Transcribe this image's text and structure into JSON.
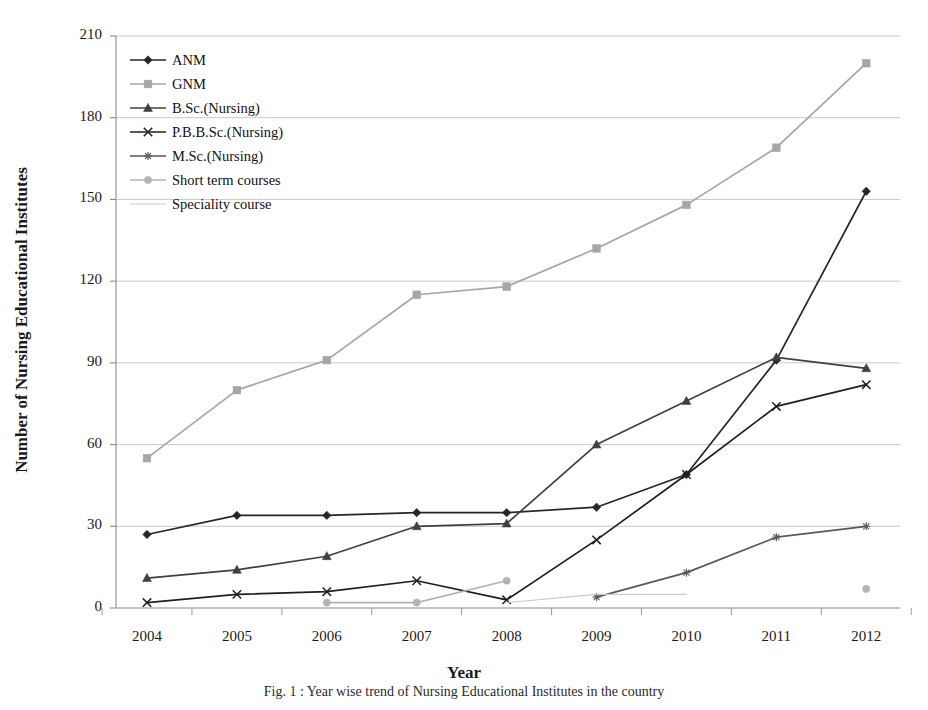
{
  "chart_data": {
    "type": "line",
    "title": "",
    "xlabel": "Year",
    "ylabel": "Number of Nursing Educational Institutes",
    "categories": [
      "2004",
      "2005",
      "2006",
      "2007",
      "2008",
      "2009",
      "2010",
      "2011",
      "2012"
    ],
    "x": [
      2004,
      2005,
      2006,
      2007,
      2008,
      2009,
      2010,
      2011,
      2012
    ],
    "ylim": [
      0,
      210
    ],
    "yticks": [
      0,
      30,
      60,
      90,
      120,
      150,
      180,
      210
    ],
    "grid": "horizontal",
    "legend_position": "upper-left",
    "series": [
      {
        "name": "ANM",
        "marker": "diamond",
        "color": "#262626",
        "values": [
          27,
          34,
          34,
          35,
          35,
          37,
          49,
          91,
          153
        ]
      },
      {
        "name": "GNM",
        "marker": "square",
        "color": "#a6a6a6",
        "values": [
          55,
          80,
          91,
          115,
          118,
          132,
          148,
          169,
          200
        ]
      },
      {
        "name": "B.Sc.(Nursing)",
        "marker": "triangle",
        "color": "#404040",
        "values": [
          11,
          14,
          19,
          30,
          31,
          60,
          76,
          92,
          88
        ]
      },
      {
        "name": "P.B.B.Sc.(Nursing)",
        "marker": "x",
        "color": "#1f1f1f",
        "values": [
          2,
          5,
          6,
          10,
          3,
          25,
          49,
          74,
          82
        ]
      },
      {
        "name": "M.Sc.(Nursing)",
        "marker": "star",
        "color": "#595959",
        "values": [
          null,
          null,
          null,
          null,
          null,
          4,
          13,
          26,
          30
        ]
      },
      {
        "name": "Short term courses",
        "marker": "circle",
        "color": "#b3b3b3",
        "values": [
          null,
          null,
          2,
          2,
          10,
          null,
          null,
          null,
          7
        ]
      },
      {
        "name": "Speciality course",
        "marker": "none",
        "color": "#c9c9c9",
        "values": [
          null,
          null,
          null,
          null,
          2,
          5,
          5,
          null,
          null
        ]
      }
    ]
  },
  "legend": {
    "items": [
      {
        "label": "ANM"
      },
      {
        "label": "GNM"
      },
      {
        "label": "B.Sc.(Nursing)"
      },
      {
        "label": "P.B.B.Sc.(Nursing)"
      },
      {
        "label": "M.Sc.(Nursing)"
      },
      {
        "label": "Short term courses"
      },
      {
        "label": "Speciality course"
      }
    ]
  },
  "caption": "Fig. 1 : Year wise trend of Nursing Educational Institutes in the country"
}
